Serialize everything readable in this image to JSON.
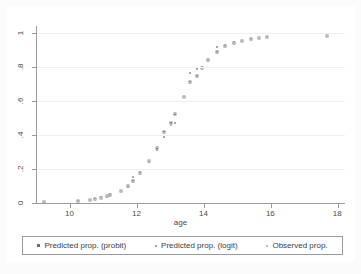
{
  "chart_data": {
    "type": "scatter",
    "title": "",
    "xlabel": "age",
    "ylabel": "",
    "xlim": [
      9.0,
      18.2
    ],
    "ylim": [
      0,
      1.04
    ],
    "xticks": [
      10,
      12,
      14,
      16,
      18
    ],
    "xtick_labels": [
      "10",
      "12",
      "14",
      "16",
      "18"
    ],
    "yticks": [
      0,
      0.2,
      0.4,
      0.6,
      0.8,
      1
    ],
    "ytick_labels": [
      "0",
      ".2",
      ".4",
      ".6",
      ".8",
      "1"
    ],
    "grid": "horizontal",
    "legend_position": "bottom",
    "series": [
      {
        "name": "Predicted prop. (probit)",
        "marker": "square",
        "color": "#8b8b8b",
        "points": [
          [
            9.2,
            0.005
          ],
          [
            10.22,
            0.01
          ],
          [
            10.58,
            0.018
          ],
          [
            10.72,
            0.022
          ],
          [
            10.92,
            0.03
          ],
          [
            11.08,
            0.04
          ],
          [
            11.18,
            0.047
          ],
          [
            11.52,
            0.07
          ],
          [
            11.72,
            0.1
          ],
          [
            11.88,
            0.13
          ],
          [
            12.08,
            0.175
          ],
          [
            12.34,
            0.245
          ],
          [
            12.58,
            0.325
          ],
          [
            12.8,
            0.42
          ],
          [
            13.0,
            0.468
          ],
          [
            13.12,
            0.522
          ],
          [
            13.38,
            0.622
          ],
          [
            13.58,
            0.712
          ],
          [
            13.78,
            0.748
          ],
          [
            13.92,
            0.795
          ],
          [
            14.12,
            0.84
          ],
          [
            14.38,
            0.888
          ],
          [
            14.62,
            0.922
          ],
          [
            14.88,
            0.938
          ],
          [
            15.12,
            0.952
          ],
          [
            15.38,
            0.962
          ],
          [
            15.62,
            0.97
          ],
          [
            15.88,
            0.974
          ],
          [
            17.66,
            0.982
          ]
        ]
      },
      {
        "name": "Predicted prop. (logit)",
        "marker": "square-small",
        "color": "#a8a8a8",
        "points": [
          [
            9.2,
            0.004
          ],
          [
            10.22,
            0.012
          ],
          [
            10.58,
            0.016
          ],
          [
            10.72,
            0.024
          ],
          [
            10.92,
            0.034
          ],
          [
            11.08,
            0.036
          ],
          [
            11.18,
            0.05
          ],
          [
            11.52,
            0.068
          ],
          [
            11.72,
            0.096
          ],
          [
            11.88,
            0.15
          ],
          [
            12.08,
            0.18
          ],
          [
            12.34,
            0.242
          ],
          [
            12.58,
            0.31
          ],
          [
            12.8,
            0.388
          ],
          [
            13.0,
            0.466
          ],
          [
            13.12,
            0.47
          ],
          [
            13.38,
            0.62
          ],
          [
            13.58,
            0.765
          ],
          [
            13.78,
            0.786
          ],
          [
            13.92,
            0.8
          ],
          [
            14.12,
            0.84
          ],
          [
            14.38,
            0.918
          ],
          [
            14.62,
            0.93
          ],
          [
            14.88,
            0.944
          ],
          [
            15.12,
            0.954
          ],
          [
            15.38,
            0.963
          ],
          [
            15.62,
            0.97
          ],
          [
            15.88,
            0.975
          ],
          [
            17.66,
            0.983
          ]
        ]
      },
      {
        "name": "Observed prop.",
        "marker": "dot",
        "color": "#bcbcbc",
        "points": [
          [
            9.2,
            0.006
          ],
          [
            10.22,
            0.008
          ],
          [
            10.58,
            0.02
          ],
          [
            10.72,
            0.018
          ],
          [
            10.92,
            0.028
          ],
          [
            11.08,
            0.044
          ],
          [
            11.18,
            0.044
          ],
          [
            11.52,
            0.072
          ],
          [
            11.72,
            0.104
          ],
          [
            11.88,
            0.122
          ],
          [
            12.08,
            0.168
          ],
          [
            12.34,
            0.248
          ],
          [
            12.58,
            0.33
          ],
          [
            12.8,
            0.41
          ],
          [
            13.0,
            0.46
          ],
          [
            13.12,
            0.53
          ],
          [
            13.38,
            0.625
          ],
          [
            13.58,
            0.705
          ],
          [
            13.78,
            0.742
          ],
          [
            13.92,
            0.79
          ],
          [
            14.12,
            0.845
          ],
          [
            14.38,
            0.88
          ],
          [
            14.62,
            0.915
          ],
          [
            14.88,
            0.934
          ],
          [
            15.12,
            0.95
          ],
          [
            15.38,
            0.96
          ],
          [
            15.62,
            0.968
          ],
          [
            15.88,
            0.976
          ],
          [
            17.66,
            0.98
          ]
        ]
      }
    ]
  }
}
